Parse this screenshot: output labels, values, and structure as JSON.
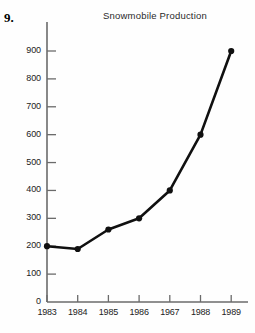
{
  "problem": {
    "number": "9."
  },
  "chart_data": {
    "type": "line",
    "title": "Snowmobile Production",
    "xlabel": "",
    "ylabel": "",
    "categories": [
      "1983",
      "1984",
      "1985",
      "1986",
      "1967",
      "1988",
      "1989"
    ],
    "values": [
      200,
      190,
      260,
      300,
      400,
      600,
      900
    ],
    "series": [
      {
        "name": "Snowmobile Production",
        "values": [
          200,
          190,
          260,
          300,
          400,
          600,
          900
        ]
      }
    ],
    "ylim": [
      0,
      900
    ],
    "yticks": [
      0,
      100,
      200,
      300,
      400,
      500,
      600,
      700,
      800,
      900
    ],
    "ytick_labels": [
      "0",
      "100",
      "200",
      "300",
      "400",
      "500",
      "600",
      "700",
      "800",
      "900"
    ],
    "xtick_labels": [
      "1983",
      "1984",
      "1985",
      "1986",
      "1967",
      "1988",
      "1989"
    ],
    "grid": false,
    "legend": false,
    "marker": "filled-circle",
    "line_color": "#101010",
    "marker_color": "#101010",
    "axis_color": "#6b6b6b",
    "background_color": "#fefefe"
  }
}
